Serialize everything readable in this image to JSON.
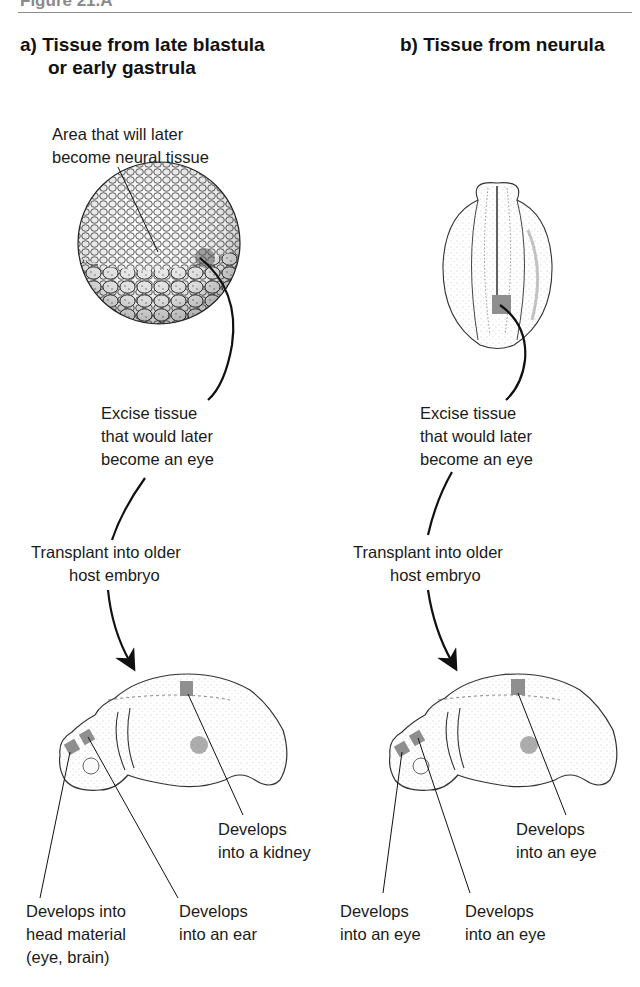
{
  "figure": {
    "title": "Figure 21.A"
  },
  "panel_a": {
    "heading_line1": "a) Tissue from late blastula",
    "heading_line2": "or early gastrula",
    "donor_label_line1": "Area that will later",
    "donor_label_line2": "become neural tissue",
    "excise_line1": "Excise tissue",
    "excise_line2": "that would later",
    "excise_line3": "become an eye",
    "transplant_line1": "Transplant into older",
    "transplant_line2": "host embryo",
    "outcome_kidney_line1": "Develops",
    "outcome_kidney_line2": "into a kidney",
    "outcome_head_line1": "Develops into",
    "outcome_head_line2": "head material",
    "outcome_head_line3": "(eye, brain)",
    "outcome_ear_line1": "Develops",
    "outcome_ear_line2": "into an ear"
  },
  "panel_b": {
    "heading": "b) Tissue from neurula",
    "excise_line1": "Excise tissue",
    "excise_line2": "that would later",
    "excise_line3": "become an eye",
    "transplant_line1": "Transplant into older",
    "transplant_line2": "host embryo",
    "outcome_dorsal_line1": "Develops",
    "outcome_dorsal_line2": "into an eye",
    "outcome_front_line1": "Develops",
    "outcome_front_line2": "into an eye",
    "outcome_second_line1": "Develops",
    "outcome_second_line2": "into an eye"
  },
  "colors": {
    "graft_tissue": "#8f8f8f",
    "line": "#111111",
    "title_gray": "#8a8a8a"
  }
}
